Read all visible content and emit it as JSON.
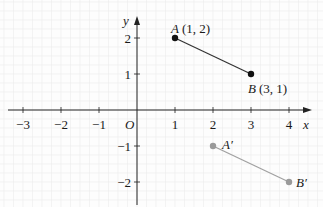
{
  "diagram": {
    "type": "coordinate-plane",
    "axes": {
      "x_label": "x",
      "y_label": "y",
      "origin_label": "O",
      "x_ticks": [
        {
          "value": -3,
          "label": "−3"
        },
        {
          "value": -2,
          "label": "−2"
        },
        {
          "value": -1,
          "label": "−1"
        },
        {
          "value": 1,
          "label": "1"
        },
        {
          "value": 2,
          "label": "2"
        },
        {
          "value": 3,
          "label": "3"
        },
        {
          "value": 4,
          "label": "4"
        }
      ],
      "y_ticks": [
        {
          "value": 2,
          "label": "2"
        },
        {
          "value": 1,
          "label": "1"
        },
        {
          "value": -1,
          "label": "−1"
        },
        {
          "value": -2,
          "label": "−2"
        }
      ]
    },
    "points": [
      {
        "name": "A",
        "coord_label": "(1, 2)",
        "x": 1,
        "y": 2,
        "color": "#111111"
      },
      {
        "name": "B",
        "coord_label": "(3, 1)",
        "x": 3,
        "y": 1,
        "color": "#111111"
      },
      {
        "name": "A′",
        "coord_label": "",
        "x": 2,
        "y": -1,
        "color": "#9a9a9a"
      },
      {
        "name": "B′",
        "coord_label": "",
        "x": 4,
        "y": -2,
        "color": "#9a9a9a"
      }
    ],
    "segments": [
      {
        "from": "A",
        "to": "B",
        "color": "#333333"
      },
      {
        "from": "A′",
        "to": "B′",
        "color": "#a0a0a0"
      }
    ],
    "labels": {
      "A": "A",
      "A_coord": "(1, 2)",
      "B": "B",
      "B_coord": "(3, 1)",
      "A_prime": "A′",
      "B_prime": "B′"
    }
  }
}
